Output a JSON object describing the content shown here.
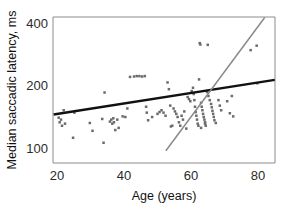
{
  "chart_data": {
    "type": "scatter",
    "title": "",
    "xlabel": "Age (years)",
    "ylabel": "Median saccadic latency, ms",
    "xlim": [
      18,
      85
    ],
    "ylim": [
      88,
      470
    ],
    "yscale": "log",
    "xscale": "linear",
    "grid": false,
    "legend": "none",
    "xticks": [
      20,
      40,
      60,
      80
    ],
    "xticklabels": [
      "20",
      "40",
      "60",
      "80"
    ],
    "yticks": [
      100,
      200,
      400
    ],
    "yticklabels": [
      "100",
      "200",
      "400"
    ],
    "series": [
      {
        "name": "Participants",
        "marker": "small-square",
        "color": "#6b6b6b",
        "points": [
          [
            20.5,
            140
          ],
          [
            20.8,
            133
          ],
          [
            21.2,
            137
          ],
          [
            21.5,
            128
          ],
          [
            22.0,
            152
          ],
          [
            22.4,
            131
          ],
          [
            24.8,
            112
          ],
          [
            25.2,
            148
          ],
          [
            29.8,
            132
          ],
          [
            30.6,
            121
          ],
          [
            33.5,
            138
          ],
          [
            33.9,
            106
          ],
          [
            34.2,
            185
          ],
          [
            35.8,
            134
          ],
          [
            36.2,
            137
          ],
          [
            36.5,
            131
          ],
          [
            36.8,
            139
          ],
          [
            37.0,
            133
          ],
          [
            37.4,
            122
          ],
          [
            38.0,
            137
          ],
          [
            38.4,
            125
          ],
          [
            41.8,
            220
          ],
          [
            43.0,
            221
          ],
          [
            43.8,
            222
          ],
          [
            44.6,
            222
          ],
          [
            45.4,
            221
          ],
          [
            46.2,
            222
          ],
          [
            39.6,
            142
          ],
          [
            40.4,
            141
          ],
          [
            41.0,
            155
          ],
          [
            46.6,
            158
          ],
          [
            46.8,
            148
          ],
          [
            47.2,
            136
          ],
          [
            48.4,
            141
          ],
          [
            50.0,
            146
          ],
          [
            50.6,
            149
          ],
          [
            51.2,
            152
          ],
          [
            51.8,
            148
          ],
          [
            52.4,
            143
          ],
          [
            53.0,
            207
          ],
          [
            53.4,
            192
          ],
          [
            53.8,
            160
          ],
          [
            54.0,
            127
          ],
          [
            54.4,
            128
          ],
          [
            54.8,
            155
          ],
          [
            55.2,
            150
          ],
          [
            55.6,
            146
          ],
          [
            56.0,
            141
          ],
          [
            56.4,
            133
          ],
          [
            56.8,
            128
          ],
          [
            57.2,
            143
          ],
          [
            57.6,
            137
          ],
          [
            58.0,
            150
          ],
          [
            58.6,
            124
          ],
          [
            59.0,
            176
          ],
          [
            59.4,
            172
          ],
          [
            59.8,
            168
          ],
          [
            60.2,
            188
          ],
          [
            60.6,
            195
          ],
          [
            60.8,
            182
          ],
          [
            61.0,
            170
          ],
          [
            61.2,
            158
          ],
          [
            61.4,
            149
          ],
          [
            61.6,
            143
          ],
          [
            61.8,
            137
          ],
          [
            62.0,
            131
          ],
          [
            62.2,
            128
          ],
          [
            62.4,
            214
          ],
          [
            62.6,
            320
          ],
          [
            62.8,
            315
          ],
          [
            63.0,
            165
          ],
          [
            63.2,
            158
          ],
          [
            63.4,
            152
          ],
          [
            63.6,
            146
          ],
          [
            63.8,
            141
          ],
          [
            64.0,
            137
          ],
          [
            64.2,
            133
          ],
          [
            64.4,
            128
          ],
          [
            64.8,
            186
          ],
          [
            65.2,
            178
          ],
          [
            65.6,
            170
          ],
          [
            66.0,
            163
          ],
          [
            66.2,
            157
          ],
          [
            66.4,
            151
          ],
          [
            66.6,
            146
          ],
          [
            66.8,
            141
          ],
          [
            67.0,
            136
          ],
          [
            67.4,
            132
          ],
          [
            65.0,
            314
          ],
          [
            64.2,
            131
          ],
          [
            63.0,
            125
          ],
          [
            68.2,
            170
          ],
          [
            68.6,
            160
          ],
          [
            69.0,
            152
          ],
          [
            70.8,
            168
          ],
          [
            71.6,
            147
          ],
          [
            72.2,
            178
          ],
          [
            72.6,
            142
          ],
          [
            77.8,
            296
          ],
          [
            79.6,
            311
          ],
          [
            79.8,
            205
          ]
        ]
      }
    ],
    "fit_lines": [
      {
        "name": "overall-regression",
        "style": "solid-black",
        "color": "#111111",
        "x_start": 19.0,
        "y_start": 145,
        "x_end": 85.0,
        "y_end": 213
      },
      {
        "name": "older-subgroup-regression",
        "style": "solid-gray",
        "color": "#8a8a8a",
        "x_start": 52.5,
        "y_start": 97,
        "x_end": 82.0,
        "y_end": 425
      }
    ]
  }
}
